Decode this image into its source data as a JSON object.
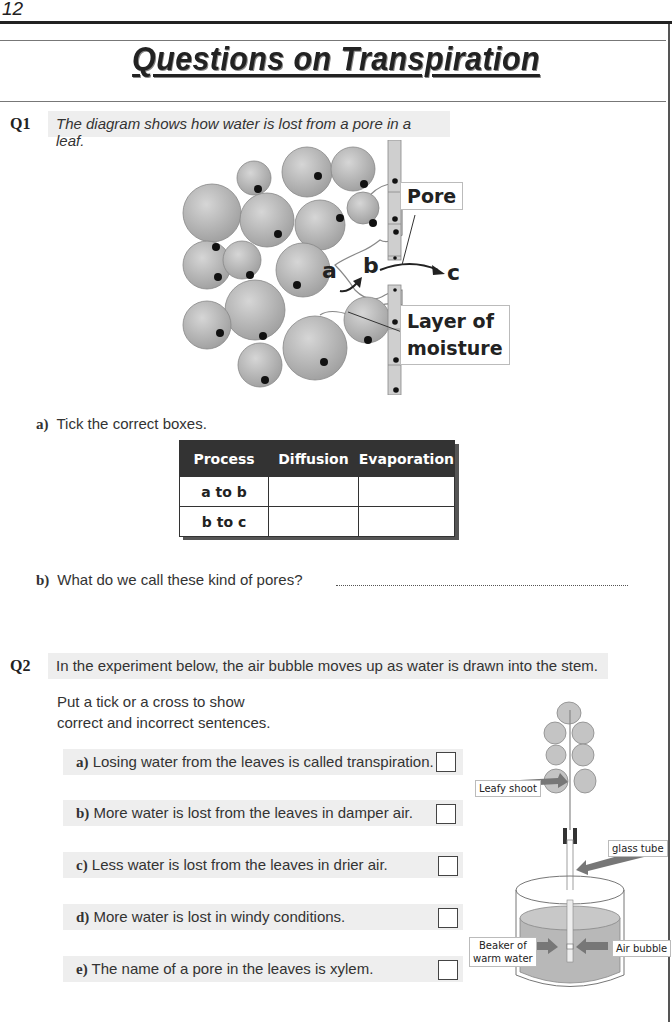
{
  "page": {
    "number": "12",
    "title": "Questions on Transpiration"
  },
  "q1": {
    "number": "Q1",
    "prompt": "The diagram shows how water is lost from a pore in a leaf.",
    "diagram": {
      "labels": {
        "pore": "Pore",
        "moisture_line1": "Layer of",
        "moisture_line2": "moisture",
        "a": "a",
        "b": "b",
        "c": "c"
      }
    },
    "part_a": {
      "letter": "a)",
      "text": "Tick the correct boxes.",
      "table": {
        "headers": [
          "Process",
          "Diffusion",
          "Evaporation"
        ],
        "rows": [
          {
            "process": "a to b",
            "diffusion": "",
            "evaporation": ""
          },
          {
            "process": "b to c",
            "diffusion": "",
            "evaporation": ""
          }
        ]
      }
    },
    "part_b": {
      "letter": "b)",
      "text": "What do we call these kind of pores?",
      "answer": ""
    }
  },
  "q2": {
    "number": "Q2",
    "prompt": "In the experiment below, the air bubble moves up as water is drawn into the stem.",
    "instruction_line1": "Put a tick or a cross to show",
    "instruction_line2": "correct and incorrect sentences.",
    "statements": [
      {
        "letter": "a)",
        "text": "Losing water from the leaves is called transpiration.",
        "checked": false
      },
      {
        "letter": "b)",
        "text": "More water is lost from the leaves in damper air.",
        "checked": false
      },
      {
        "letter": "c)",
        "text": "Less water is lost from the leaves in drier air.",
        "checked": false
      },
      {
        "letter": "d)",
        "text": "More water is lost in windy conditions.",
        "checked": false
      },
      {
        "letter": "e)",
        "text": "The name of a pore in the leaves is xylem.",
        "checked": false
      }
    ],
    "experiment_labels": {
      "leafy_shoot": "Leafy shoot",
      "glass_tube": "glass tube",
      "beaker_line1": "Beaker of",
      "beaker_line2": "warm water",
      "air_bubble": "Air bubble"
    }
  },
  "colors": {
    "banner_bg": "#eeeeee",
    "table_header_bg": "#333333",
    "cell_fill": "#bdbdbd",
    "nucleus": "#111111"
  }
}
